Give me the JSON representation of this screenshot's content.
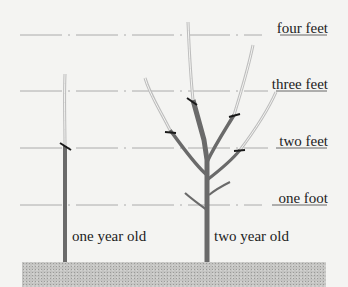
{
  "height_markers": [
    {
      "label": "four feet",
      "y": 35
    },
    {
      "label": "three feet",
      "y": 91
    },
    {
      "label": "two feet",
      "y": 148
    },
    {
      "label": "one foot",
      "y": 205
    }
  ],
  "trees": [
    {
      "label": "one year old"
    },
    {
      "label": "two year old"
    }
  ],
  "colors": {
    "trunk": "#6a6a6a",
    "new_growth": "#bdbdbd",
    "cut_mark": "#1a1a1a",
    "guide_line": "#9a9a9a",
    "ground": "#c4c4c2"
  }
}
